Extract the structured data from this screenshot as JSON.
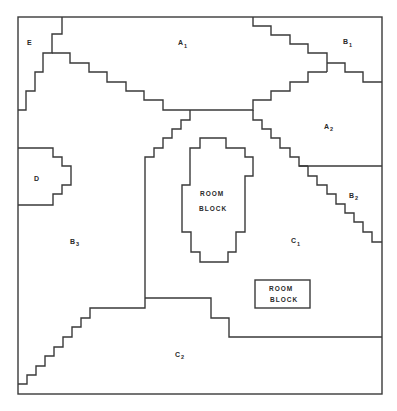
{
  "diagram": {
    "zones": [
      {
        "id": "E",
        "letter": "E",
        "sub": ""
      },
      {
        "id": "A1",
        "letter": "A",
        "sub": "1"
      },
      {
        "id": "B1",
        "letter": "B",
        "sub": "1"
      },
      {
        "id": "A2",
        "letter": "A",
        "sub": "2"
      },
      {
        "id": "D",
        "letter": "D",
        "sub": ""
      },
      {
        "id": "B2",
        "letter": "B",
        "sub": "2"
      },
      {
        "id": "B3",
        "letter": "B",
        "sub": "3"
      },
      {
        "id": "C1",
        "letter": "C",
        "sub": "1"
      },
      {
        "id": "C2",
        "letter": "C",
        "sub": "2"
      }
    ],
    "room_blocks": [
      {
        "line1": "ROOM",
        "line2": "BLOCK"
      },
      {
        "line1": "ROOM",
        "line2": "BLOCK"
      }
    ]
  }
}
